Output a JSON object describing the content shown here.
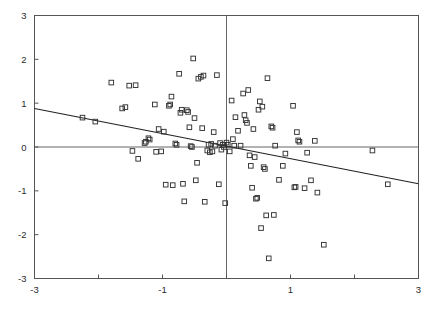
{
  "chart_data": {
    "type": "scatter",
    "title": "",
    "subtitle": "",
    "xlabel": "",
    "ylabel": "",
    "xlim": [
      -3,
      3
    ],
    "ylim": [
      -3,
      3
    ],
    "grid": false,
    "legend": null,
    "marker": "open-square",
    "marker_color": "#333333",
    "axis_color": "#555555",
    "frame": true,
    "zero_lines": {
      "x": 0,
      "y": 0,
      "visible": true
    },
    "x_ticks_major": [
      -3,
      -1,
      1,
      3
    ],
    "x_ticks_minor": [
      -2,
      0,
      2
    ],
    "x_tick_labels": [
      "-3",
      "-1",
      "1",
      "3"
    ],
    "y_ticks_major": [
      -3,
      -2,
      -1,
      0,
      1,
      2,
      3
    ],
    "y_tick_labels": [
      "3",
      "2",
      "1",
      "0",
      "-1",
      "-2",
      "-3"
    ],
    "fit_line": {
      "type": "linear",
      "x": [
        -3,
        3
      ],
      "y": [
        0.88,
        -0.84
      ],
      "slope": -0.287,
      "intercept": 0.02,
      "color": "#222222"
    },
    "n_points": 113,
    "points": [
      [
        -2.25,
        0.67
      ],
      [
        -2.05,
        0.58
      ],
      [
        -1.8,
        1.47
      ],
      [
        -1.63,
        0.88
      ],
      [
        -1.58,
        0.91
      ],
      [
        -1.52,
        1.4
      ],
      [
        -1.47,
        -0.09
      ],
      [
        -1.42,
        1.41
      ],
      [
        -1.38,
        -0.27
      ],
      [
        -1.28,
        0.09
      ],
      [
        -1.26,
        0.12
      ],
      [
        -1.22,
        0.2
      ],
      [
        -1.2,
        0.17
      ],
      [
        -1.12,
        0.97
      ],
      [
        -1.1,
        -0.11
      ],
      [
        -1.06,
        0.41
      ],
      [
        -1.02,
        -0.1
      ],
      [
        -0.98,
        0.35
      ],
      [
        -0.95,
        -0.86
      ],
      [
        -0.9,
        0.94
      ],
      [
        -0.88,
        0.97
      ],
      [
        -0.86,
        1.15
      ],
      [
        -0.84,
        -0.87
      ],
      [
        -0.8,
        0.08
      ],
      [
        -0.78,
        0.05
      ],
      [
        -0.74,
        1.67
      ],
      [
        -0.72,
        0.78
      ],
      [
        -0.7,
        0.85
      ],
      [
        -0.68,
        -0.84
      ],
      [
        -0.66,
        -1.24
      ],
      [
        -0.62,
        0.84
      ],
      [
        -0.6,
        0.8
      ],
      [
        -0.58,
        0.45
      ],
      [
        -0.56,
        0.02
      ],
      [
        -0.54,
        0.0
      ],
      [
        -0.52,
        2.02
      ],
      [
        -0.5,
        0.66
      ],
      [
        -0.48,
        -0.76
      ],
      [
        -0.46,
        -0.36
      ],
      [
        -0.44,
        1.56
      ],
      [
        -0.4,
        1.6
      ],
      [
        -0.38,
        0.43
      ],
      [
        -0.36,
        1.63
      ],
      [
        -0.34,
        -1.25
      ],
      [
        -0.3,
        -0.08
      ],
      [
        -0.28,
        0.05
      ],
      [
        -0.26,
        -0.12
      ],
      [
        -0.24,
        0.07
      ],
      [
        -0.22,
        -0.1
      ],
      [
        -0.2,
        0.34
      ],
      [
        -0.18,
        0.03
      ],
      [
        -0.15,
        1.64
      ],
      [
        -0.12,
        -0.85
      ],
      [
        -0.1,
        0.09
      ],
      [
        -0.08,
        -0.06
      ],
      [
        -0.06,
        0.05
      ],
      [
        -0.04,
        0.0
      ],
      [
        -0.02,
        -1.28
      ],
      [
        0.0,
        0.1
      ],
      [
        0.02,
        0.05
      ],
      [
        0.05,
        -0.1
      ],
      [
        0.08,
        1.06
      ],
      [
        0.1,
        0.18
      ],
      [
        0.12,
        0.03
      ],
      [
        0.14,
        0.68
      ],
      [
        0.18,
        0.37
      ],
      [
        0.22,
        0.03
      ],
      [
        0.26,
        1.22
      ],
      [
        0.28,
        0.73
      ],
      [
        0.3,
        0.61
      ],
      [
        0.32,
        0.55
      ],
      [
        0.34,
        1.3
      ],
      [
        0.36,
        -0.19
      ],
      [
        0.38,
        -0.43
      ],
      [
        0.4,
        -0.93
      ],
      [
        0.42,
        0.41
      ],
      [
        0.44,
        -0.23
      ],
      [
        0.46,
        -1.18
      ],
      [
        0.48,
        -1.16
      ],
      [
        0.5,
        0.85
      ],
      [
        0.52,
        1.04
      ],
      [
        0.54,
        -1.85
      ],
      [
        0.56,
        0.92
      ],
      [
        0.58,
        -0.46
      ],
      [
        0.6,
        -0.5
      ],
      [
        0.62,
        -1.56
      ],
      [
        0.64,
        1.57
      ],
      [
        0.66,
        -2.54
      ],
      [
        0.7,
        0.47
      ],
      [
        0.72,
        0.44
      ],
      [
        0.74,
        -1.55
      ],
      [
        0.76,
        0.03
      ],
      [
        0.82,
        -0.75
      ],
      [
        0.88,
        -0.43
      ],
      [
        0.92,
        -0.15
      ],
      [
        1.04,
        0.94
      ],
      [
        1.06,
        -0.92
      ],
      [
        1.08,
        -0.91
      ],
      [
        1.1,
        0.34
      ],
      [
        1.12,
        0.15
      ],
      [
        1.14,
        0.12
      ],
      [
        1.22,
        -0.94
      ],
      [
        1.26,
        -0.13
      ],
      [
        1.32,
        -0.76
      ],
      [
        1.38,
        0.14
      ],
      [
        1.42,
        -1.04
      ],
      [
        1.52,
        -2.23
      ],
      [
        2.28,
        -0.08
      ],
      [
        2.52,
        -0.85
      ]
    ]
  },
  "figure": {
    "background": "#ffffff",
    "frame_color": "#555555",
    "width": 435,
    "height": 310
  }
}
